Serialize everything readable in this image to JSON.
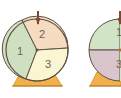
{
  "figure": {
    "spinners": [
      {
        "id": "spinner-a",
        "sections": [
          {
            "label": "1",
            "color": "#cfe0c0"
          },
          {
            "label": "2",
            "color": "#f5dcc0"
          },
          {
            "label": "3",
            "color": "#fbf6d2"
          }
        ]
      },
      {
        "id": "spinner-b",
        "sections": [
          {
            "label": "1",
            "color": "#d2e4c6"
          },
          {
            "label": "3",
            "color": "#d9c6cc"
          }
        ]
      }
    ],
    "colors": {
      "outline": "#5e5044",
      "stand": "#f2b04a",
      "stand_shade": "#e39a36",
      "pointer": "#7a4a2e"
    }
  }
}
